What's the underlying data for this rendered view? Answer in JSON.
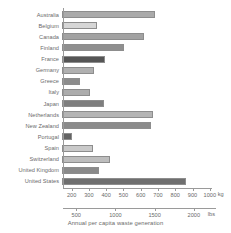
{
  "chart_data": {
    "type": "bar",
    "orientation": "horizontal",
    "title": "",
    "xlabel": "Annual per capita waste generation",
    "ylabel": "",
    "grid": false,
    "legend": null,
    "xlim": [
      150,
      1030
    ],
    "categories": [
      "Australia",
      "Belgium",
      "Canada",
      "Finland",
      "France",
      "Germany",
      "Greece",
      "Italy",
      "Japan",
      "Netherlands",
      "New Zealand",
      "Portugal",
      "Spain",
      "Switzerland",
      "United Kingdom",
      "United States"
    ],
    "values": [
      690,
      355,
      625,
      510,
      400,
      335,
      255,
      310,
      395,
      675,
      665,
      210,
      330,
      425,
      365,
      865
    ],
    "value_unit": "kg",
    "bar_colors": [
      "#aaaaaa",
      "#d6d6d6",
      "#a2a2a2",
      "#8f8f8f",
      "#555555",
      "#b0b0b0",
      "#8c8c8c",
      "#acacac",
      "#7e7e7e",
      "#b4b4b4",
      "#8b8b8b",
      "#636363",
      "#c9c9c9",
      "#bdbdbd",
      "#8a8a8a",
      "#6f6f6f"
    ],
    "axes": [
      {
        "name": "kg",
        "unit_label": "kg",
        "ticks": [
          200,
          300,
          400,
          500,
          600,
          700,
          800,
          900,
          1000
        ],
        "tick_labels": [
          "200",
          "300",
          "400",
          "500",
          "600",
          "700",
          "800",
          "900",
          "1000"
        ]
      },
      {
        "name": "lbs",
        "unit_label": "lbs",
        "ticks": [
          500,
          1000,
          1500,
          2000
        ],
        "tick_labels": [
          "500",
          "1000",
          "1500",
          "2000"
        ],
        "kg_per_lb": 0.45359237
      }
    ]
  }
}
